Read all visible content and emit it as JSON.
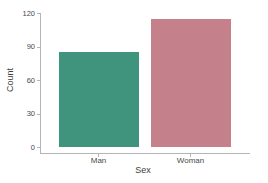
{
  "chart_data": {
    "type": "bar",
    "categories": [
      "Man",
      "Woman"
    ],
    "values": [
      85,
      115
    ],
    "series_colors": [
      "#40937c",
      "#c4808b"
    ],
    "title": "",
    "xlabel": "Sex",
    "ylabel": "Count",
    "yticks": [
      0,
      30,
      60,
      90,
      120
    ],
    "ylim": [
      0,
      120
    ],
    "grid": false,
    "legend": false
  },
  "colors": {
    "bar_man": "#40937c",
    "bar_woman": "#c4808b",
    "axis": "#b5b5b5",
    "tick_text": "#4a4a4a",
    "title_text": "#3d3d3d",
    "background": "#ffffff"
  }
}
